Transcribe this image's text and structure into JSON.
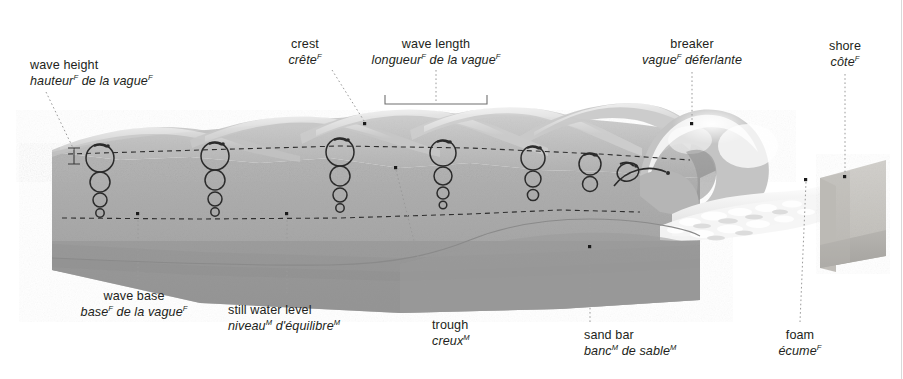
{
  "diagram": {
    "type": "cross-section block diagram",
    "language_note": "bilingual English / French terminology plate",
    "gender_marks": {
      "feminine": "F",
      "masculine": "M"
    },
    "colors": {
      "water_surface": "#b9b9b9",
      "water_body": "#a9a9a9",
      "water_deep": "#9a9a9a",
      "seabed": "#9d9d9d",
      "shore_sand": "#c8c6c2",
      "foam": "#f2f2f2",
      "label_text": "#231f20",
      "leader_line": "#8d8d8d",
      "dashed_line": "#3a3a3a",
      "circle_stroke": "#2b2b2b",
      "background": "#ffffff"
    }
  },
  "labels": [
    {
      "id": "wave-height",
      "en": "wave height",
      "fr": "hauteur de la vague",
      "fr_parts": [
        {
          "text": "hauteur",
          "sup": "F"
        },
        {
          "text": " de la vague",
          "sup": "F"
        }
      ],
      "align": "left",
      "x": 30,
      "y": 58,
      "target_x": 78,
      "target_y": 152
    },
    {
      "id": "crest",
      "en": "crest",
      "fr": "crête",
      "fr_parts": [
        {
          "text": "crête",
          "sup": "F"
        }
      ],
      "align": "center",
      "x": 305,
      "y": 37,
      "target_x": 366,
      "target_y": 125
    },
    {
      "id": "wave-length",
      "en": "wave length",
      "fr": "longueur de la vague",
      "fr_parts": [
        {
          "text": "longueur",
          "sup": "F"
        },
        {
          "text": " de la vague",
          "sup": "F"
        }
      ],
      "align": "center",
      "x": 389,
      "y": 37,
      "target_x": 436,
      "target_y": 103,
      "bracket": {
        "x1": 385,
        "x2": 487,
        "y": 103
      }
    },
    {
      "id": "breaker",
      "en": "breaker",
      "fr": "vague déferlante",
      "fr_parts": [
        {
          "text": "vague",
          "sup": "F"
        },
        {
          "text": " déferlante",
          "sup": ""
        }
      ],
      "align": "center",
      "x": 643,
      "y": 37,
      "target_x": 692,
      "target_y": 124
    },
    {
      "id": "shore",
      "en": "shore",
      "fr": "côte",
      "fr_parts": [
        {
          "text": "côte",
          "sup": "F"
        }
      ],
      "align": "center",
      "x": 812,
      "y": 39,
      "target_x": 845,
      "target_y": 177
    },
    {
      "id": "wave-base",
      "en": "wave base",
      "fr": "base de la vague",
      "fr_parts": [
        {
          "text": "base",
          "sup": "F"
        },
        {
          "text": " de la vague",
          "sup": "F"
        }
      ],
      "align": "center",
      "x": 103,
      "y": 289,
      "target_x": 138,
      "target_y": 214
    },
    {
      "id": "still-water-level",
      "en": "still water level",
      "fr": "niveau d'équilibre",
      "fr_parts": [
        {
          "text": "niveau",
          "sup": "M"
        },
        {
          "text": " d'équilibre",
          "sup": "M"
        }
      ],
      "align": "center",
      "x": 228,
      "y": 303,
      "target_x": 287,
      "target_y": 214
    },
    {
      "id": "trough",
      "en": "trough",
      "fr": "creux",
      "fr_parts": [
        {
          "text": "creux",
          "sup": "M"
        }
      ],
      "align": "center",
      "x": 432,
      "y": 318,
      "target_x": 396,
      "target_y": 168
    },
    {
      "id": "sand-bar",
      "en": "sand bar",
      "fr": "banc de sable",
      "fr_parts": [
        {
          "text": "banc",
          "sup": "M"
        },
        {
          "text": " de sable",
          "sup": "M"
        }
      ],
      "align": "center",
      "x": 584,
      "y": 328,
      "target_x": 590,
      "target_y": 247
    },
    {
      "id": "foam",
      "en": "foam",
      "fr": "écume",
      "fr_parts": [
        {
          "text": "écume",
          "sup": "F"
        }
      ],
      "align": "center",
      "x": 795,
      "y": 328,
      "target_x": 806,
      "target_y": 180
    }
  ],
  "features": {
    "orbital_circle_columns": [
      {
        "x": 100,
        "radii": [
          14,
          10,
          7,
          4
        ]
      },
      {
        "x": 215,
        "radii": [
          14,
          10,
          7,
          4
        ]
      },
      {
        "x": 340,
        "radii": [
          14,
          10,
          7,
          4
        ]
      },
      {
        "x": 443,
        "radii": [
          13,
          9,
          6,
          4
        ]
      },
      {
        "x": 533,
        "radii": [
          12,
          8,
          6,
          0
        ]
      },
      {
        "x": 590,
        "radii": [
          11,
          8,
          0,
          0
        ]
      },
      {
        "x": 625,
        "radii": [
          10,
          0,
          0,
          0
        ]
      }
    ],
    "dashed_lines": [
      {
        "name": "still-water-level",
        "note": "upper dashed line through wave crests' mean level"
      },
      {
        "name": "wave-base",
        "note": "lower dashed line marking depth limit of orbital motion"
      }
    ],
    "wave_count": 5,
    "seabed_note": "seabed rises toward shore, forming a sand bar before the breaker"
  }
}
